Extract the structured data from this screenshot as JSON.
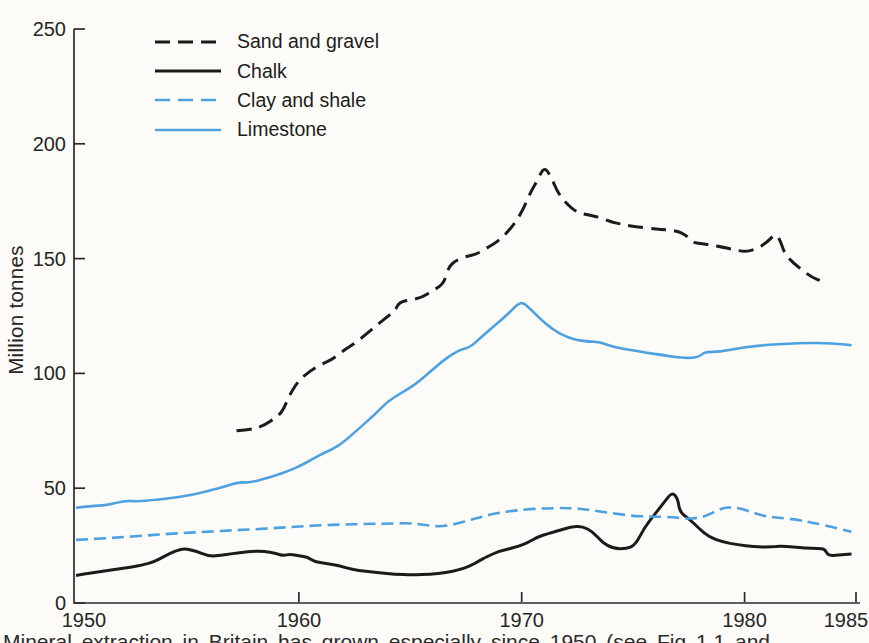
{
  "page": {
    "caption": "Mineral extraction in Britain has grown especially since 1950 (see Fig 1.1 and"
  },
  "chart_data": {
    "type": "line",
    "title": "",
    "xlabel": "",
    "ylabel": "Million tonnes",
    "xlim": [
      1950,
      1985
    ],
    "ylim": [
      0,
      250
    ],
    "x_ticks": [
      1950,
      1960,
      1970,
      1980,
      1985
    ],
    "y_ticks": [
      0,
      50,
      100,
      150,
      200,
      250
    ],
    "grid": false,
    "legend_position": "top-left",
    "axis_color": "#2b2b2b",
    "text_color": "#262626",
    "series": [
      {
        "name": "Sand and gravel",
        "color": "#1b1b1b",
        "dash": "15 8",
        "width": 3,
        "points": [
          [
            1957.2,
            75
          ],
          [
            1957.8,
            75.5
          ],
          [
            1958.4,
            77
          ],
          [
            1959.0,
            81
          ],
          [
            1959.3,
            84
          ],
          [
            1959.6,
            91
          ],
          [
            1960,
            97
          ],
          [
            1960.5,
            101
          ],
          [
            1961,
            104
          ],
          [
            1961.5,
            106
          ],
          [
            1962,
            110
          ],
          [
            1962.5,
            113
          ],
          [
            1963,
            117
          ],
          [
            1963.5,
            121
          ],
          [
            1964,
            125
          ],
          [
            1964.3,
            127
          ],
          [
            1964.5,
            131
          ],
          [
            1965,
            132
          ],
          [
            1965.5,
            133
          ],
          [
            1966,
            136
          ],
          [
            1966.5,
            139
          ],
          [
            1966.7,
            146
          ],
          [
            1967,
            149
          ],
          [
            1967.5,
            151
          ],
          [
            1968,
            152
          ],
          [
            1968.5,
            155
          ],
          [
            1969,
            158
          ],
          [
            1969.5,
            163
          ],
          [
            1970,
            170
          ],
          [
            1970.4,
            179
          ],
          [
            1970.7,
            184
          ],
          [
            1971,
            190
          ],
          [
            1971.3,
            186
          ],
          [
            1971.6,
            179
          ],
          [
            1972,
            174
          ],
          [
            1972.5,
            170
          ],
          [
            1973,
            169
          ],
          [
            1973.5,
            168
          ],
          [
            1974,
            166
          ],
          [
            1974.5,
            165
          ],
          [
            1975,
            164
          ],
          [
            1976,
            163
          ],
          [
            1976.5,
            162.5
          ],
          [
            1977,
            162
          ],
          [
            1977.4,
            160
          ],
          [
            1977.7,
            157
          ],
          [
            1978,
            156.5
          ],
          [
            1978.5,
            156
          ],
          [
            1979,
            155
          ],
          [
            1979.5,
            154
          ],
          [
            1980,
            153
          ],
          [
            1980.5,
            154
          ],
          [
            1981,
            157
          ],
          [
            1981.4,
            161
          ],
          [
            1981.6,
            158
          ],
          [
            1981.8,
            152
          ],
          [
            1982.2,
            148
          ],
          [
            1982.6,
            145
          ],
          [
            1983,
            142
          ],
          [
            1983.5,
            140
          ]
        ]
      },
      {
        "name": "Chalk",
        "color": "#1b1b1b",
        "dash": null,
        "width": 3,
        "points": [
          [
            1950,
            12
          ],
          [
            1950.5,
            12.8
          ],
          [
            1951,
            13.5
          ],
          [
            1952,
            15
          ],
          [
            1953,
            16.5
          ],
          [
            1953.5,
            18
          ],
          [
            1954,
            20.5
          ],
          [
            1954.5,
            23
          ],
          [
            1954.9,
            23.7
          ],
          [
            1955.4,
            22.5
          ],
          [
            1956,
            20.3
          ],
          [
            1956.5,
            20.8
          ],
          [
            1957,
            21.5
          ],
          [
            1957.7,
            22.3
          ],
          [
            1958.4,
            22.7
          ],
          [
            1959,
            21.5
          ],
          [
            1959.3,
            20.6
          ],
          [
            1959.6,
            21.3
          ],
          [
            1960,
            20.5
          ],
          [
            1960.4,
            20
          ],
          [
            1960.7,
            18
          ],
          [
            1961.2,
            17.2
          ],
          [
            1961.8,
            16.3
          ],
          [
            1962.4,
            14.6
          ],
          [
            1963,
            13.8
          ],
          [
            1963.6,
            13.2
          ],
          [
            1964.3,
            12.6
          ],
          [
            1965.1,
            12.2
          ],
          [
            1965.9,
            12.6
          ],
          [
            1966.6,
            13.2
          ],
          [
            1967.2,
            14.5
          ],
          [
            1967.7,
            16.2
          ],
          [
            1968.1,
            18.5
          ],
          [
            1968.4,
            20
          ],
          [
            1969,
            22.7
          ],
          [
            1969.8,
            24.4
          ],
          [
            1970.3,
            26.4
          ],
          [
            1970.7,
            28.7
          ],
          [
            1971.2,
            30.3
          ],
          [
            1971.6,
            31.4
          ],
          [
            1972.2,
            33.1
          ],
          [
            1972.7,
            33.5
          ],
          [
            1973.2,
            31
          ],
          [
            1973.6,
            26.5
          ],
          [
            1974.1,
            23.7
          ],
          [
            1974.7,
            23.6
          ],
          [
            1975.1,
            25.3
          ],
          [
            1975.5,
            32.7
          ],
          [
            1976,
            39
          ],
          [
            1976.4,
            44
          ],
          [
            1976.75,
            48.3
          ],
          [
            1977,
            45.5
          ],
          [
            1977.1,
            39.5
          ],
          [
            1977.5,
            36.8
          ],
          [
            1978,
            32
          ],
          [
            1978.4,
            28.8
          ],
          [
            1979,
            26.6
          ],
          [
            1979.7,
            25.3
          ],
          [
            1980.4,
            24.5
          ],
          [
            1981.2,
            24.4
          ],
          [
            1981.6,
            24.8
          ],
          [
            1982.2,
            24.4
          ],
          [
            1982.7,
            24
          ],
          [
            1983.3,
            23.7
          ],
          [
            1983.6,
            23.5
          ],
          [
            1983.75,
            20.6
          ],
          [
            1984.2,
            20.9
          ],
          [
            1984.8,
            21.3
          ]
        ]
      },
      {
        "name": "Clay and shale",
        "color": "#4da1e0",
        "dash": "12 6",
        "width": 2.6,
        "points": [
          [
            1950,
            27.5
          ],
          [
            1951,
            28
          ],
          [
            1952,
            28.6
          ],
          [
            1953,
            29.3
          ],
          [
            1954,
            30
          ],
          [
            1955,
            30.6
          ],
          [
            1956,
            31.1
          ],
          [
            1957,
            31.6
          ],
          [
            1958,
            32.1
          ],
          [
            1959,
            32.7
          ],
          [
            1960,
            33.3
          ],
          [
            1961,
            33.9
          ],
          [
            1962,
            34.2
          ],
          [
            1963,
            34.4
          ],
          [
            1964,
            34.6
          ],
          [
            1965,
            34.8
          ],
          [
            1965.6,
            34
          ],
          [
            1966.3,
            33.2
          ],
          [
            1967,
            34.3
          ],
          [
            1967.7,
            36.2
          ],
          [
            1968.3,
            37.8
          ],
          [
            1968.9,
            39.2
          ],
          [
            1969.5,
            40
          ],
          [
            1970.2,
            40.8
          ],
          [
            1971,
            41.2
          ],
          [
            1971.8,
            41.4
          ],
          [
            1972.5,
            41.2
          ],
          [
            1973.2,
            40.3
          ],
          [
            1974,
            39.2
          ],
          [
            1974.9,
            38
          ],
          [
            1975.8,
            37.6
          ],
          [
            1976.7,
            37.5
          ],
          [
            1977.3,
            36.7
          ],
          [
            1977.8,
            36.9
          ],
          [
            1978.3,
            38
          ],
          [
            1978.8,
            40.5
          ],
          [
            1979.2,
            41.8
          ],
          [
            1979.8,
            41.3
          ],
          [
            1980.4,
            39.3
          ],
          [
            1981,
            37.6
          ],
          [
            1981.6,
            37.1
          ],
          [
            1982.4,
            36.2
          ],
          [
            1983.1,
            34.9
          ],
          [
            1983.9,
            33.2
          ],
          [
            1984.4,
            32
          ],
          [
            1984.8,
            31
          ]
        ]
      },
      {
        "name": "Limestone",
        "color": "#4da1e0",
        "dash": null,
        "width": 2.6,
        "points": [
          [
            1950,
            41.5
          ],
          [
            1950.7,
            42.3
          ],
          [
            1951.3,
            42.6
          ],
          [
            1951.8,
            43.6
          ],
          [
            1952.3,
            44.6
          ],
          [
            1952.8,
            44.2
          ],
          [
            1953.4,
            44.8
          ],
          [
            1954,
            45.4
          ],
          [
            1954.7,
            46.3
          ],
          [
            1955.3,
            47.4
          ],
          [
            1956,
            49
          ],
          [
            1956.7,
            50.8
          ],
          [
            1957.3,
            52.7
          ],
          [
            1957.8,
            52.4
          ],
          [
            1958.4,
            54
          ],
          [
            1959,
            55.6
          ],
          [
            1959.6,
            57.8
          ],
          [
            1960,
            59.5
          ],
          [
            1960.5,
            62
          ],
          [
            1961,
            64.8
          ],
          [
            1961.5,
            67
          ],
          [
            1962,
            70
          ],
          [
            1962.7,
            76
          ],
          [
            1963.4,
            82
          ],
          [
            1964,
            88
          ],
          [
            1964.6,
            91.5
          ],
          [
            1965.2,
            95
          ],
          [
            1965.8,
            100
          ],
          [
            1966.4,
            105
          ],
          [
            1966.9,
            108.5
          ],
          [
            1967.3,
            110.5
          ],
          [
            1967.7,
            111.5
          ],
          [
            1968.2,
            116
          ],
          [
            1968.8,
            121
          ],
          [
            1969.4,
            126
          ],
          [
            1969.8,
            130
          ],
          [
            1970.05,
            131
          ],
          [
            1970.4,
            128
          ],
          [
            1970.8,
            124
          ],
          [
            1971.4,
            119
          ],
          [
            1972,
            116
          ],
          [
            1972.5,
            114.5
          ],
          [
            1973,
            113.8
          ],
          [
            1973.5,
            113.7
          ],
          [
            1974.1,
            111.5
          ],
          [
            1975,
            110
          ],
          [
            1975.6,
            109
          ],
          [
            1976.3,
            108
          ],
          [
            1977,
            107
          ],
          [
            1977.6,
            106.6
          ],
          [
            1978,
            107.5
          ],
          [
            1978.2,
            109.3
          ],
          [
            1978.9,
            109.4
          ],
          [
            1979.7,
            111
          ],
          [
            1980.4,
            111.8
          ],
          [
            1981,
            112.4
          ],
          [
            1982,
            113
          ],
          [
            1982.8,
            113.3
          ],
          [
            1983.6,
            113.2
          ],
          [
            1984.2,
            112.9
          ],
          [
            1984.8,
            112.3
          ]
        ]
      }
    ]
  }
}
